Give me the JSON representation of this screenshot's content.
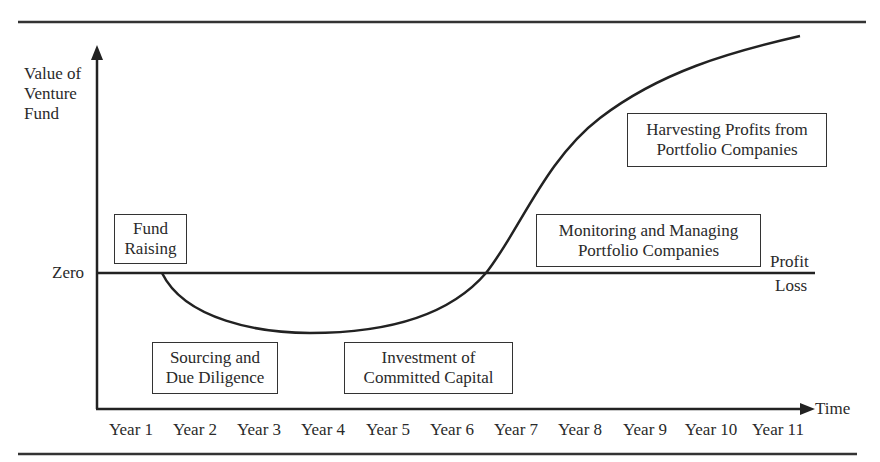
{
  "diagram": {
    "y_axis_label": [
      "Value of",
      "Venture",
      "Fund"
    ],
    "x_axis_label": "Time",
    "zero_label": "Zero",
    "profit_label": "Profit",
    "loss_label": "Loss",
    "x_ticks": [
      "Year 1",
      "Year 2",
      "Year 3",
      "Year 4",
      "Year 5",
      "Year 6",
      "Year 7",
      "Year 8",
      "Year 9",
      "Year 10",
      "Year 11"
    ],
    "stages": [
      {
        "line1": "Fund",
        "line2": "Raising"
      },
      {
        "line1": "Sourcing and",
        "line2": "Due Diligence"
      },
      {
        "line1": "Investment of",
        "line2": "Committed Capital"
      },
      {
        "line1": "Monitoring and Managing",
        "line2": "Portfolio Companies"
      },
      {
        "line1": "Harvesting Profits from",
        "line2": "Portfolio Companies"
      }
    ],
    "colors": {
      "ink": "#2a2a2a",
      "background": "#ffffff"
    }
  }
}
